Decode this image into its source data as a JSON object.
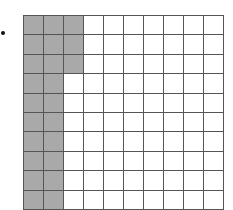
{
  "diagram": {
    "type": "hundred-grid",
    "rows": 10,
    "cols": 10,
    "shaded_count": 23,
    "shaded_full_columns": 2,
    "shaded_partial_column_cells": 3,
    "colors": {
      "shaded": "#a9a9a9",
      "unshaded": "#ffffff",
      "line": "#555555"
    }
  }
}
